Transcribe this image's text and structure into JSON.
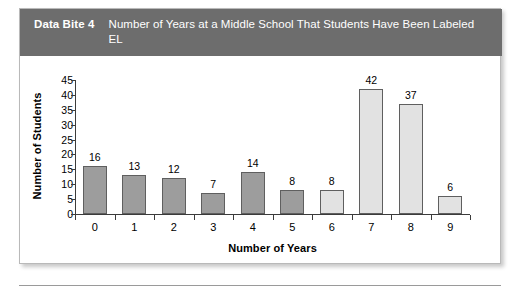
{
  "figure": {
    "bite_label": "Data Bite 4",
    "title": "Number of Years at a Middle School That Students Have Been Labeled EL"
  },
  "colors": {
    "header_band": "#6d6d6d",
    "bar_dark": "#9d9d9d",
    "bar_light": "#e2e2e2",
    "bar_outline": "#5f5f5f",
    "axis": "#3b3b3b",
    "card_border": "#b9b9b9"
  },
  "chart_data": {
    "type": "bar",
    "title": "Number of Years at a Middle School That Students Have Been Labeled EL",
    "xlabel": "Number of Years",
    "ylabel": "Number of Students",
    "categories": [
      "0",
      "1",
      "2",
      "3",
      "4",
      "5",
      "6",
      "7",
      "8",
      "9"
    ],
    "values": [
      16,
      13,
      12,
      7,
      14,
      8,
      8,
      42,
      37,
      6
    ],
    "bar_shades": [
      "dark",
      "dark",
      "dark",
      "dark",
      "dark",
      "dark",
      "light",
      "light",
      "light",
      "light"
    ],
    "ylim": [
      0,
      45
    ],
    "ytick_values": [
      0,
      5,
      10,
      15,
      20,
      25,
      30,
      35,
      40,
      45
    ],
    "ytick_labels": [
      "0",
      "5",
      "10",
      "15",
      "20",
      "25",
      "30",
      "35",
      "40",
      "45"
    ],
    "grid": false,
    "legend": null
  }
}
